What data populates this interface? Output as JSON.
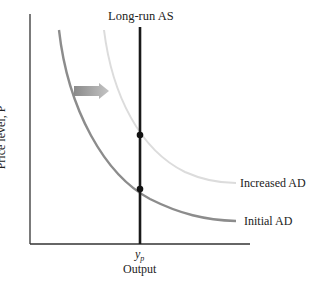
{
  "diagram": {
    "title": "Long-run AS",
    "y_axis_label": "Price level, P",
    "x_axis_label": "Output",
    "x_tick_label_base": "y",
    "x_tick_label_sub": "p",
    "curves": [
      {
        "name": "Long-run AS",
        "type": "vertical",
        "color": "#1a1a1a"
      },
      {
        "name": "Initial AD",
        "color": "#8c8c8c"
      },
      {
        "name": "Increased AD",
        "color": "#dcdcdc"
      }
    ],
    "labels": {
      "initial_ad": "Initial AD",
      "increased_ad": "Increased AD"
    },
    "shift_arrow": {
      "direction": "right",
      "color": "#999999"
    },
    "equilibrium_points": [
      {
        "curve": "Increased AD",
        "on": "Long-run AS"
      },
      {
        "curve": "Initial AD",
        "on": "Long-run AS"
      }
    ]
  }
}
